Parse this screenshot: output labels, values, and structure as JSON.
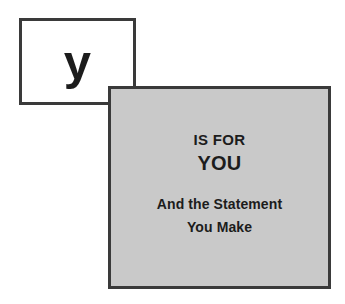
{
  "scene": {
    "background_color": "#ffffff",
    "width": 345,
    "height": 304
  },
  "letter_card": {
    "letter": "y",
    "background_color": "#ffffff",
    "border_color": "#3a3a3a",
    "text_color": "#1c1c1c"
  },
  "statement_panel": {
    "background_color": "#c9c9c9",
    "border_color": "#3a3a3a",
    "text_color": "#1c1c1c",
    "lines": {
      "is_for": "IS FOR",
      "subject": "YOU",
      "sub_line_1": "And the Statement",
      "sub_line_2": "You Make"
    }
  }
}
